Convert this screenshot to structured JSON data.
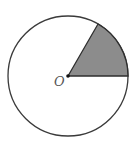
{
  "diagram": {
    "type": "circle-sector",
    "center_label": "O",
    "sector_angle_deg": 60,
    "sector_start_deg": 0,
    "colors": {
      "stroke": "#3a3a3a",
      "sector_fill": "#8c8c8c",
      "background": "#ffffff",
      "label": "#555555"
    }
  }
}
